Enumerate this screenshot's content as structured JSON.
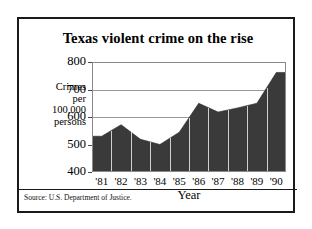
{
  "chart_data": {
    "type": "area",
    "title": "Texas violent crime on the rise",
    "xlabel": "Year",
    "ylabel_lines": [
      "Crimes",
      "per",
      "100,000",
      "persons"
    ],
    "ylabel": "Crimes per 100,000 persons",
    "categories": [
      "'81",
      "'82",
      "'83",
      "'84",
      "'85",
      "'86",
      "'87",
      "'88",
      "'89",
      "'90"
    ],
    "values": [
      530,
      572,
      519,
      500,
      545,
      650,
      618,
      633,
      650,
      762
    ],
    "ylim": [
      400,
      800
    ],
    "yticks": [
      800,
      700,
      600,
      500,
      400
    ],
    "xlim_labels": [
      "'81",
      "'90"
    ],
    "grid": true,
    "legend": "none",
    "series": [
      {
        "name": "Texas violent crime rate per 100,000 persons",
        "values": [
          530,
          572,
          519,
          500,
          545,
          650,
          618,
          633,
          650,
          762
        ]
      }
    ],
    "annotations": [],
    "source": "Source:  U.S. Department of Justice.",
    "colors": {
      "area_fill": "#3a3a3a",
      "frame": "#1a1a1a",
      "gridline": "#9a9a9a",
      "year_separator": "#cfcfcf",
      "background": "#ffffff",
      "text": "#000000"
    }
  },
  "figure": {
    "title": "Texas violent crime on the rise",
    "source_note": "Source:  U.S. Department of Justice."
  }
}
